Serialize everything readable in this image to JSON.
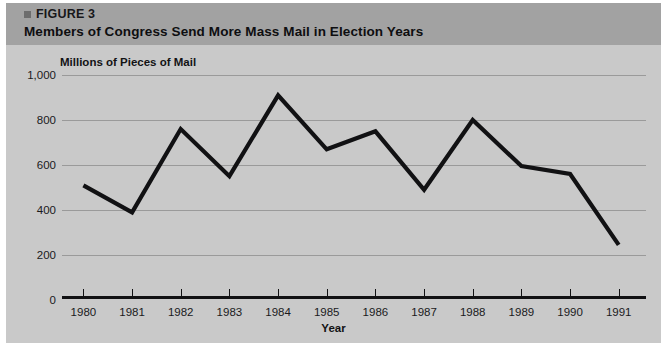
{
  "figure": {
    "bullet_icon": "square-bullet-icon",
    "label": "FIGURE 3",
    "title": "Members of Congress Send More Mass Mail in Election Years"
  },
  "colors": {
    "header_band": "#a2a2a2",
    "figure_background": "#c9c9c9",
    "gridline": "#9a9a9a",
    "axis": "#111113",
    "series_line": "#111113",
    "text": "#1a1a1c"
  },
  "chart_data": {
    "type": "line",
    "title": "Members of Congress Send More Mass Mail in Election Years",
    "subtitle": "Millions of Pieces of Mail",
    "xlabel": "Year",
    "ylabel": "Millions of Pieces of Mail",
    "categories": [
      "1980",
      "1981",
      "1982",
      "1983",
      "1984",
      "1985",
      "1986",
      "1987",
      "1988",
      "1989",
      "1990",
      "1991"
    ],
    "x": [
      1980,
      1981,
      1982,
      1983,
      1984,
      1985,
      1986,
      1987,
      1988,
      1989,
      1990,
      1991
    ],
    "values": [
      510,
      390,
      760,
      550,
      910,
      670,
      750,
      490,
      800,
      595,
      560,
      245
    ],
    "series": [
      {
        "name": "Mass Mail",
        "values": [
          510,
          390,
          760,
          550,
          910,
          670,
          750,
          490,
          800,
          595,
          560,
          245
        ]
      }
    ],
    "ylim": [
      0,
      1000
    ],
    "ytick_labels": [
      "1,000",
      "800",
      "600",
      "400",
      "200",
      "0"
    ],
    "ytick_values": [
      1000,
      800,
      600,
      400,
      200,
      0
    ],
    "xtick_labels": [
      "1980",
      "1981",
      "1982",
      "1983",
      "1984",
      "1985",
      "1986",
      "1987",
      "1988",
      "1989",
      "1990",
      "1991"
    ],
    "grid": "horizontal",
    "legend": "none",
    "annotations": []
  }
}
